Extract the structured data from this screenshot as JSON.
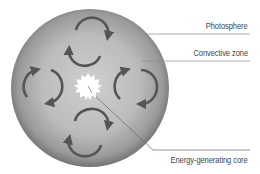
{
  "diagram": {
    "labels": {
      "photosphere": "Photosphere",
      "convective_zone": "Convective zone",
      "core": "Energy-generating core"
    },
    "colors": {
      "sphere_center": "#c4c4c4",
      "sphere_edge": "#7a7a7a",
      "arrows": "#555555",
      "core": "#ffffff",
      "leader_lines": "#888888",
      "text": "#444444"
    },
    "convection_cells": [
      {
        "position": "top",
        "cx": 88,
        "cy": 42
      },
      {
        "position": "left",
        "cx": 43,
        "cy": 86
      },
      {
        "position": "right",
        "cx": 133,
        "cy": 86
      },
      {
        "position": "bottom",
        "cx": 88,
        "cy": 132
      }
    ]
  }
}
